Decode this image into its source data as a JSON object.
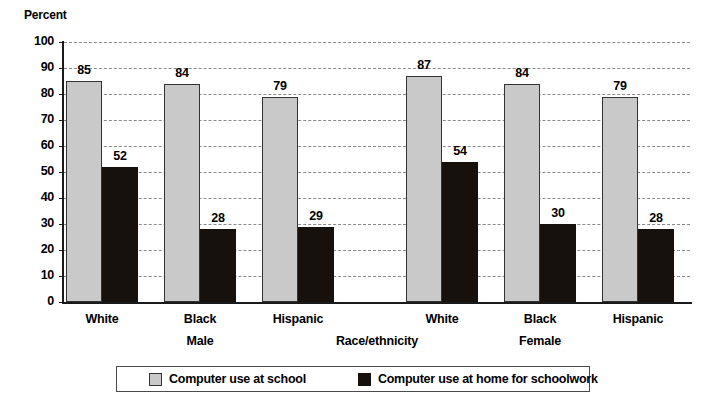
{
  "chart_data": {
    "type": "bar",
    "title": "",
    "ylabel": "Percent",
    "xlabel": "Race/ethnicity",
    "ylim": [
      0,
      100
    ],
    "ytick_step": 10,
    "yticks": [
      "100",
      "90",
      "80",
      "70",
      "60",
      "50",
      "40",
      "30",
      "20",
      "10",
      "0"
    ],
    "grid": true,
    "legend_position": "bottom",
    "categories": [
      "White",
      "Black",
      "Hispanic",
      "White",
      "Black",
      "Hispanic"
    ],
    "group_labels": [
      "Male",
      "Female"
    ],
    "series": [
      {
        "name": "Computer use at school",
        "color": "#c9c9c9",
        "values": [
          85,
          84,
          79,
          87,
          84,
          79
        ]
      },
      {
        "name": "Computer use at home for schoolwork",
        "color": "#17110d",
        "values": [
          52,
          28,
          29,
          54,
          30,
          28
        ]
      }
    ],
    "groups": [
      {
        "category": "White",
        "sex": "Male",
        "school": 85,
        "home": 52
      },
      {
        "category": "Black",
        "sex": "Male",
        "school": 84,
        "home": 28
      },
      {
        "category": "Hispanic",
        "sex": "Male",
        "school": 79,
        "home": 29
      },
      {
        "category": "White",
        "sex": "Female",
        "school": 87,
        "home": 54
      },
      {
        "category": "Black",
        "sex": "Female",
        "school": 84,
        "home": 30
      },
      {
        "category": "Hispanic",
        "sex": "Female",
        "school": 79,
        "home": 28
      }
    ]
  },
  "legend": {
    "items": [
      {
        "label": "Computer use at school",
        "color": "#c9c9c9"
      },
      {
        "label": "Computer use at home for schoolwork",
        "color": "#17110d"
      }
    ]
  }
}
